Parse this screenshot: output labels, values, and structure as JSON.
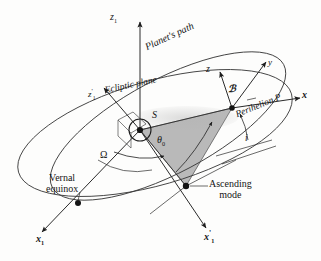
{
  "figure": {
    "kind": "orbital-elements-diagram",
    "background_color": "#fdfdfc",
    "line_color": "#2b2b2b",
    "shaded_sector_color": "#a8a8a8"
  },
  "labels": {
    "z1_axis": "z",
    "z1_axis_sub": "1",
    "planets_path": "Planet's path",
    "ecliptic_plane": "Ecliptic plane",
    "z1_prime_axis": "z",
    "z1_prime_sub": "1",
    "z1_prime_mark": "'",
    "z_axis": "z",
    "y_axis": "y",
    "x_axis": "x",
    "body": "ℬ",
    "perihelion": "Perihelion P",
    "sun": "S",
    "omega": "Ω",
    "theta_zero": "θ",
    "theta_zero_sub": "0",
    "inclination": "i",
    "vernal_equinox_line1": "Vernal",
    "vernal_equinox_line2": "equinox",
    "ascending_node_line1": "Ascending",
    "ascending_node_line2": "mode",
    "x1_axis": "x",
    "x1_axis_sub": "1",
    "x1_prime_axis": "x",
    "x1_prime_sub": "1",
    "x1_prime_mark": "'"
  },
  "geometry": {
    "sun_origin": [
      140,
      130
    ],
    "ascending_node_point": [
      186,
      186
    ],
    "vernal_equinox_point": [
      78,
      203
    ],
    "body_point": [
      232,
      108
    ],
    "ecliptic_ellipse": {
      "cx": 155,
      "cy": 133,
      "rx": 142,
      "ry": 52,
      "rotation_deg": -16
    },
    "orbit_ellipse": {
      "cx": 168,
      "cy": 128,
      "rx": 132,
      "ry": 48,
      "rotation_deg": -25
    }
  }
}
